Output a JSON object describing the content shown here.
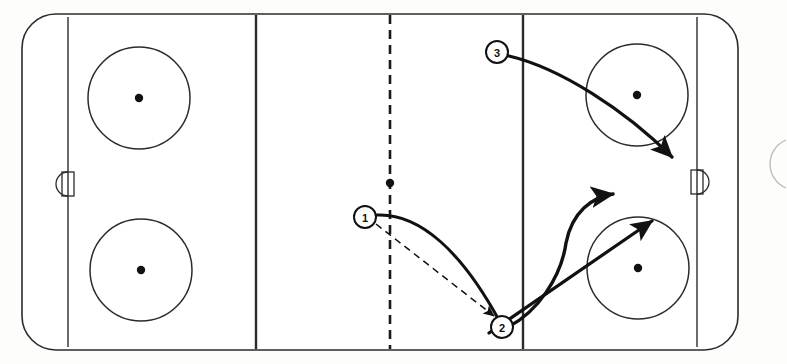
{
  "diagram": {
    "type": "hockey-rink-drill",
    "colors": {
      "ink": "#1a1a1a",
      "line": "#2b2b2b",
      "paper": "#fdfdfc",
      "play_line": "#111111"
    }
  },
  "rink": {
    "outline": {
      "name": "rink-boards",
      "x": 22,
      "y": 14,
      "width": 716,
      "height": 336,
      "corner_radius": 34
    },
    "goal_lines": [
      {
        "name": "goal-line-left",
        "x": 68,
        "y1": 17,
        "y2": 347
      },
      {
        "name": "goal-line-right",
        "x": 697,
        "y1": 17,
        "y2": 347
      }
    ],
    "blue_lines": [
      {
        "name": "blue-line-left",
        "x": 256,
        "y1": 15,
        "y2": 349
      },
      {
        "name": "blue-line-right",
        "x": 523,
        "y1": 15,
        "y2": 349
      }
    ],
    "center_line": {
      "name": "center-line",
      "x": 390,
      "y1": 15,
      "y2": 349,
      "style": "dashed"
    },
    "center_dot": {
      "name": "center-ice-dot",
      "cx": 390,
      "cy": 183,
      "r": 4
    },
    "faceoff_circles": [
      {
        "name": "faceoff-circle-top-left",
        "cx": 139,
        "cy": 98,
        "r": 51,
        "dot_r": 4
      },
      {
        "name": "faceoff-circle-bottom-left",
        "cx": 141,
        "cy": 270,
        "r": 51,
        "dot_r": 4
      },
      {
        "name": "faceoff-circle-top-right",
        "cx": 637,
        "cy": 95,
        "r": 51,
        "dot_r": 4
      },
      {
        "name": "faceoff-circle-bottom-right",
        "cx": 638,
        "cy": 268,
        "r": 51,
        "dot_r": 4
      }
    ],
    "goals": [
      {
        "name": "goal-left",
        "x": 57,
        "y": 172,
        "width": 13,
        "height": 24,
        "crease_side": "left"
      },
      {
        "name": "goal-right",
        "x": 695,
        "y": 170,
        "width": 13,
        "height": 24,
        "crease_side": "right"
      }
    ],
    "margin_arc": {
      "name": "page-margin-arc",
      "cx": 800,
      "cy": 163,
      "r": 26
    }
  },
  "players": [
    {
      "name": "player-marker-1",
      "label": "1",
      "cx": 365,
      "cy": 217,
      "r": 11
    },
    {
      "name": "player-marker-2",
      "label": "2",
      "cx": 502,
      "cy": 327,
      "r": 11
    },
    {
      "name": "player-marker-3",
      "label": "3",
      "cx": 497,
      "cy": 52,
      "r": 11
    }
  ],
  "movement_paths": [
    {
      "name": "skate-path-player-1",
      "style": "solid",
      "arrow": false,
      "description": "Player 1 carries puck from the center line curving down to the right circle hash area",
      "d": "M 377 215 C 420 213 462 252 500 322"
    },
    {
      "name": "pass-path-player-1-to-2",
      "style": "dashed",
      "arrow": true,
      "description": "Pass from player 1 to player 2",
      "d": "M 376 224 L 494 316"
    },
    {
      "name": "skate-path-player-2-curl",
      "style": "solid",
      "arrow": true,
      "description": "Player 2 curls up ice toward the slot",
      "d": "M 497 332 C 540 316 562 272 566 243 C 572 212 592 197 613 194"
    },
    {
      "name": "skate-path-player-2-drive",
      "style": "solid",
      "arrow": true,
      "description": "Straight drive from the corner up through the bottom right circle",
      "d": "M 489 333 L 652 221"
    },
    {
      "name": "skate-path-player-3",
      "style": "solid",
      "arrow": true,
      "description": "Player 3 skates from the right blue line across the top circle to the net",
      "d": "M 509 56 C 560 68 625 110 672 157"
    }
  ]
}
